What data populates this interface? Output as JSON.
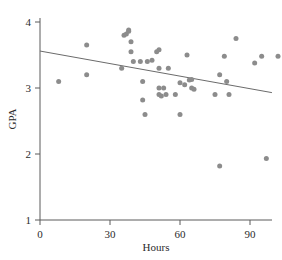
{
  "chart_data": {
    "type": "scatter",
    "title": "",
    "subtitle": "",
    "xlabel": "Hours",
    "ylabel": "GPA",
    "xlim": [
      0,
      117
    ],
    "ylim": [
      1,
      4.2
    ],
    "xticks": [
      0,
      30,
      60,
      90
    ],
    "xtick_labels": [
      "0",
      "30",
      "60",
      "90"
    ],
    "yticks": [
      1,
      2,
      3,
      4
    ],
    "ytick_labels": [
      "1",
      "2",
      "3",
      "4"
    ],
    "grid": false,
    "legend": false,
    "legend_position": "none",
    "marker": {
      "shape": "circle",
      "color": "#8c8c8c",
      "size": 5,
      "opacity": 1
    },
    "series": [
      {
        "name": "Students",
        "type": "scatter",
        "points": [
          {
            "x": 8,
            "y": 3.1
          },
          {
            "x": 20,
            "y": 3.65
          },
          {
            "x": 20,
            "y": 3.2
          },
          {
            "x": 35,
            "y": 3.3
          },
          {
            "x": 36,
            "y": 3.8
          },
          {
            "x": 37,
            "y": 3.82
          },
          {
            "x": 38,
            "y": 3.88
          },
          {
            "x": 38,
            "y": 3.86
          },
          {
            "x": 39,
            "y": 3.7
          },
          {
            "x": 39,
            "y": 3.55
          },
          {
            "x": 40,
            "y": 3.4
          },
          {
            "x": 43,
            "y": 3.4
          },
          {
            "x": 44,
            "y": 3.1
          },
          {
            "x": 44,
            "y": 2.82
          },
          {
            "x": 45,
            "y": 2.6
          },
          {
            "x": 46,
            "y": 3.4
          },
          {
            "x": 48,
            "y": 3.42
          },
          {
            "x": 50,
            "y": 3.55
          },
          {
            "x": 51,
            "y": 3.58
          },
          {
            "x": 51,
            "y": 3.3
          },
          {
            "x": 51,
            "y": 3.0
          },
          {
            "x": 51,
            "y": 2.9
          },
          {
            "x": 52,
            "y": 2.88
          },
          {
            "x": 53,
            "y": 3.0
          },
          {
            "x": 54,
            "y": 2.9
          },
          {
            "x": 55,
            "y": 3.3
          },
          {
            "x": 58,
            "y": 2.9
          },
          {
            "x": 60,
            "y": 3.08
          },
          {
            "x": 60,
            "y": 2.6
          },
          {
            "x": 62,
            "y": 3.05
          },
          {
            "x": 63,
            "y": 3.5
          },
          {
            "x": 64,
            "y": 3.12
          },
          {
            "x": 65,
            "y": 3.13
          },
          {
            "x": 65,
            "y": 3.0
          },
          {
            "x": 66,
            "y": 2.98
          },
          {
            "x": 75,
            "y": 2.9
          },
          {
            "x": 77,
            "y": 3.2
          },
          {
            "x": 77,
            "y": 1.82
          },
          {
            "x": 79,
            "y": 3.48
          },
          {
            "x": 80,
            "y": 3.1
          },
          {
            "x": 81,
            "y": 2.9
          },
          {
            "x": 84,
            "y": 3.75
          },
          {
            "x": 92,
            "y": 3.38
          },
          {
            "x": 95,
            "y": 3.48
          },
          {
            "x": 97,
            "y": 1.93
          },
          {
            "x": 102,
            "y": 3.48
          }
        ]
      },
      {
        "name": "Least-squares regression line",
        "type": "line",
        "color": "#6b6b6b",
        "x_start": 0,
        "y_start": 3.56,
        "x_end": 99.4,
        "y_end": 2.93,
        "slope": -0.0063,
        "intercept": 3.56
      }
    ]
  },
  "axes": {
    "x_title": "Hours",
    "y_title": "GPA"
  }
}
